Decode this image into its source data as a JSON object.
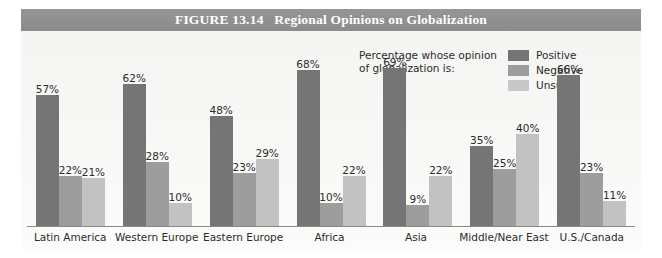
{
  "figure": {
    "title_prefix": "FIGURE 13.14",
    "title": "FIGURE 13.14   Regional Opinions on Globalization",
    "band_color": "#8f8f8f",
    "panel_color": "#f6f6f4"
  },
  "legend": {
    "caption_line1": "Percentage whose opinion",
    "caption_line2": "of globalization is:",
    "caption": "Percentage whose opinion\nof globalization is:",
    "items": [
      {
        "label": "Positive",
        "color": "#757575"
      },
      {
        "label": "Negative",
        "color": "#9d9d9d"
      },
      {
        "label": "Unsure",
        "color": "#c8c8c8"
      }
    ]
  },
  "chart_data": {
    "type": "bar",
    "title": "FIGURE 13.14   Regional Opinions on Globalization",
    "xlabel": "",
    "ylabel": "",
    "ylim": [
      0,
      75
    ],
    "grid": false,
    "legend_position": "top-center",
    "value_suffix": "%",
    "categories": [
      "Latin America",
      "Western Europe",
      "Eastern Europe",
      "Africa",
      "Asia",
      "Middle/Near East",
      "U.S./Canada"
    ],
    "series": [
      {
        "name": "Positive",
        "color": "#757575",
        "values": [
          57,
          62,
          48,
          68,
          69,
          35,
          66
        ],
        "labels": [
          "57%",
          "62%",
          "48%",
          "68%",
          "69%",
          "35%",
          "66%"
        ]
      },
      {
        "name": "Negative",
        "color": "#9d9d9d",
        "values": [
          22,
          28,
          23,
          10,
          9,
          25,
          23
        ],
        "labels": [
          "22%",
          "28%",
          "23%",
          "10%",
          "9%",
          "25%",
          "23%"
        ]
      },
      {
        "name": "Unsure",
        "color": "#c2c2c2",
        "values": [
          21,
          10,
          29,
          22,
          22,
          40,
          11
        ],
        "labels": [
          "21%",
          "10%",
          "29%",
          "22%",
          "22%",
          "11%"
        ]
      }
    ],
    "groups": [
      {
        "category": "Latin America",
        "positive": 57,
        "negative": 22,
        "unsure": 21,
        "positive_label": "57%",
        "negative_label": "22%",
        "unsure_label": "21%"
      },
      {
        "category": "Western Europe",
        "positive": 62,
        "negative": 28,
        "unsure": 10,
        "positive_label": "62%",
        "negative_label": "28%",
        "unsure_label": "10%"
      },
      {
        "category": "Eastern Europe",
        "positive": 48,
        "negative": 23,
        "unsure": 29,
        "positive_label": "48%",
        "negative_label": "23%",
        "unsure_label": "29%"
      },
      {
        "category": "Africa",
        "positive": 68,
        "negative": 10,
        "unsure": 22,
        "positive_label": "68%",
        "negative_label": "10%",
        "unsure_label": "22%"
      },
      {
        "category": "Asia",
        "positive": 69,
        "negative": 9,
        "unsure": 22,
        "positive_label": "69%",
        "negative_label": "9%",
        "unsure_label": "22%"
      },
      {
        "category": "Middle/Near East",
        "positive": 35,
        "negative": 25,
        "unsure": 40,
        "positive_label": "35%",
        "negative_label": "25%",
        "unsure_label": "40%"
      },
      {
        "category": "U.S./Canada",
        "positive": 66,
        "negative": 23,
        "unsure": 11,
        "positive_label": "66%",
        "negative_label": "23%",
        "unsure_label": "11%"
      }
    ]
  }
}
